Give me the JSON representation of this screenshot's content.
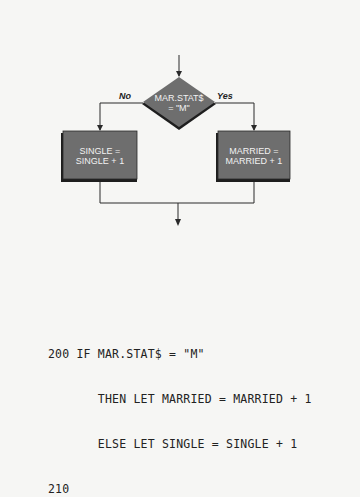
{
  "flowchart": {
    "decision": {
      "line1": "MAR.STAT$",
      "line2": "= \"M\""
    },
    "branches": {
      "no_label": "No",
      "yes_label": "Yes"
    },
    "left_process": {
      "line1": "SINGLE =",
      "line2": "SINGLE + 1"
    },
    "right_process": {
      "line1": "MARRIED =",
      "line2": "MARRIED + 1"
    },
    "colors": {
      "shape_fill": "#6e6e6e",
      "shape_shadow": "#1e1e1e",
      "line": "#2a2a2a",
      "background": "#f6f6f4"
    }
  },
  "code": {
    "lines": [
      "200 IF MAR.STAT$ = \"M\"",
      "       THEN LET MARRIED = MARRIED + 1",
      "       ELSE LET SINGLE = SINGLE + 1",
      "210"
    ]
  }
}
